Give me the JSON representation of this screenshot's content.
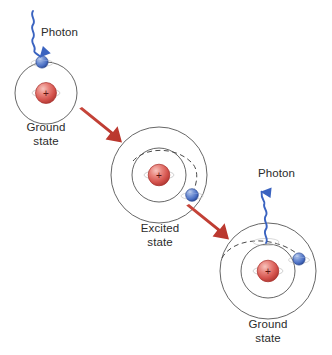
{
  "figure": {
    "background_color": "#ffffff"
  },
  "colors": {
    "nucleus": "#d4524c",
    "nucleus_highlight": "#f0a39c",
    "nucleus_edge": "#a8312d",
    "electron": "#4a6fc4",
    "electron_highlight": "#9fb6e4",
    "electron_edge": "#2c4a93",
    "photon_wave": "#3a63c0",
    "arrow": "#c0392f",
    "orbit": "#555555",
    "text": "#2b2b2b"
  },
  "labels": {
    "photon_in": "Photon",
    "photon_out": "Photon",
    "ground_state_1": "Ground\nstate",
    "excited_state": "Excited\nstate",
    "ground_state_2": "Ground\nstate"
  },
  "atoms": [
    {
      "id": "atom-ground-initial",
      "state": "Ground state",
      "center": [
        46,
        93
      ],
      "orbits": [
        31
      ],
      "electron": {
        "position": [
          42,
          63
        ],
        "on_orbit": "inner"
      },
      "nucleus_charge": "+",
      "dashed_transition": false
    },
    {
      "id": "atom-excited",
      "state": "Excited state",
      "center": [
        159,
        175
      ],
      "orbits": [
        27,
        48
      ],
      "electron": {
        "position": [
          192,
          196
        ],
        "on_orbit": "outer"
      },
      "nucleus_charge": "+",
      "dashed_transition": true
    },
    {
      "id": "atom-ground-final",
      "state": "Ground state",
      "center": [
        268,
        271
      ],
      "orbits": [
        27,
        48
      ],
      "electron": {
        "position": [
          298,
          259
        ],
        "on_orbit": "outer"
      },
      "nucleus_charge": "+",
      "dashed_transition": true
    }
  ],
  "photons": [
    {
      "id": "photon-incoming",
      "label": "Photon",
      "direction": "down",
      "from": [
        33,
        10
      ],
      "to": [
        42,
        60
      ],
      "label_position": [
        41,
        24
      ]
    },
    {
      "id": "photon-outgoing",
      "label": "Photon",
      "direction": "up",
      "from": [
        266,
        243
      ],
      "to": [
        262,
        186
      ],
      "label_position": [
        258,
        166
      ]
    }
  ],
  "arrows": [
    {
      "id": "arrow-absorb",
      "from": [
        82,
        108
      ],
      "to": [
        122,
        141
      ],
      "color": "#c0392f"
    },
    {
      "id": "arrow-emit",
      "from": [
        188,
        205
      ],
      "to": [
        229,
        238
      ],
      "color": "#c0392f"
    }
  ],
  "nucleus_sign": "+"
}
